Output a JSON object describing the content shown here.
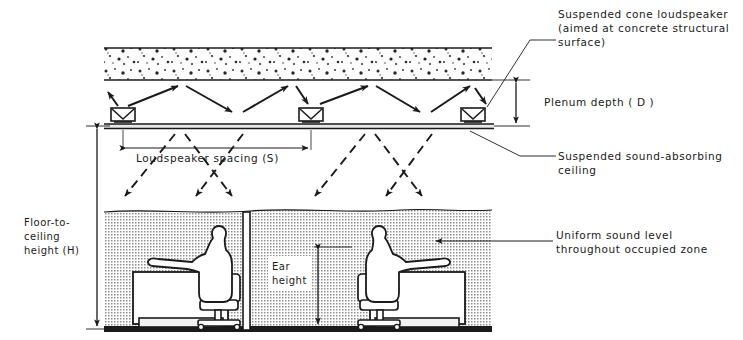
{
  "diagram": {
    "colors": {
      "ink": "#1a1a1a",
      "slab_fill": "#fbfbfb",
      "zone_fill": "#d9d9d9",
      "figure_fill": "#ffffff",
      "paper": "#ffffff"
    },
    "annotations": {
      "speaker": {
        "line1": "Suspended cone loudspeaker",
        "line2": "(aimed at concrete structural",
        "line3": "surface)"
      },
      "plenum": {
        "label": "Plenum depth ( D )"
      },
      "ceiling": {
        "line1": "Suspended sound-absorbing",
        "line2": "ceiling"
      },
      "uniform": {
        "line1": "Uniform sound level",
        "line2": "throughout occupied zone"
      },
      "height": {
        "line1": "Floor-to-",
        "line2": "ceiling",
        "line3": "height (H)"
      },
      "spacing": {
        "label": "Loudspeaker spacing (S)"
      },
      "ear": {
        "line1": "Ear",
        "line2": "height"
      }
    },
    "elements": {
      "concrete_slab": "concrete structural slab",
      "suspended_ceiling": "suspended sound-absorbing ceiling",
      "occupied_zone": "uniform sound level occupied zone",
      "partition": "workstation partition",
      "floor": "floor line",
      "speaker_count": 4,
      "workstation_count": 2
    }
  }
}
